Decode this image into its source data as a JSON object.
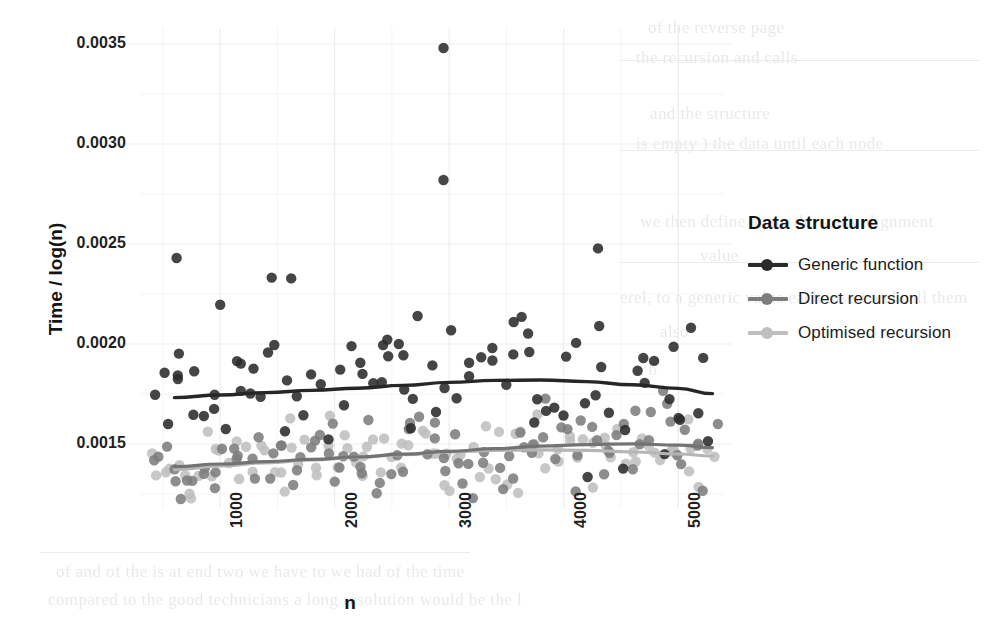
{
  "chart_data": {
    "type": "scatter",
    "title": "",
    "xlabel": "n",
    "ylabel": "Time / log(n)",
    "xlim": [
      300,
      5400
    ],
    "ylim": [
      0.00118,
      0.00358
    ],
    "xticks": [
      1000,
      2000,
      3000,
      4000,
      5000
    ],
    "xtick_labels": [
      "1000",
      "2000",
      "3000",
      "4000",
      "5000"
    ],
    "yticks": [
      0.0015,
      0.002,
      0.0025,
      0.003,
      0.0035
    ],
    "ytick_labels": [
      "0.0015",
      "0.0020",
      "0.0025",
      "0.0030",
      "0.0035"
    ],
    "y_minor_ticks": [
      0.00125,
      0.00175,
      0.00225,
      0.00275,
      0.00325
    ],
    "x_minor_ticks": [
      500,
      1500,
      2500,
      3500,
      4500,
      5000
    ],
    "grid": true,
    "grid_color": "#ededed",
    "grid_minor_color": "#f4f4f4",
    "panel_background": "#ffffff",
    "point_radius": 5.2,
    "point_opacity": 0.88,
    "legend": {
      "title": "Data structure",
      "position": "right",
      "entries": [
        {
          "label": "Generic function",
          "color": "#2b2b2b"
        },
        {
          "label": "Direct recursion",
          "color": "#7d7d7d"
        },
        {
          "label": "Optimised recursion",
          "color": "#bfbfbf"
        }
      ]
    },
    "series": [
      {
        "name": "Generic function",
        "color": "#2b2b2b",
        "n_points": 78,
        "trend": {
          "type": "loess",
          "color": "#262626",
          "width": 3.4,
          "points": [
            [
              600,
              0.001732
            ],
            [
              1000,
              0.001745
            ],
            [
              1400,
              0.001757
            ],
            [
              1800,
              0.001768
            ],
            [
              2200,
              0.001779
            ],
            [
              2600,
              0.001793
            ],
            [
              3000,
              0.001808
            ],
            [
              3400,
              0.001818
            ],
            [
              3800,
              0.00182
            ],
            [
              4200,
              0.001812
            ],
            [
              4600,
              0.001796
            ],
            [
              5000,
              0.001778
            ],
            [
              5300,
              0.001752
            ]
          ]
        },
        "scatter_band": {
          "center_offset": 0.0,
          "spread": 0.000165
        },
        "outliers": [
          [
            2950,
            0.00348
          ],
          [
            2950,
            0.00282
          ],
          [
            4300,
            0.002478
          ],
          [
            620,
            0.00243
          ],
          [
            1450,
            0.002332
          ],
          [
            1620,
            0.002328
          ],
          [
            1000,
            0.002196
          ],
          [
            4310,
            0.00209
          ],
          [
            640,
            0.001952
          ],
          [
            1180,
            0.001902
          ],
          [
            2460,
            0.002022
          ],
          [
            2560,
            0.002
          ],
          [
            2600,
            0.001944
          ],
          [
            3700,
            0.00196
          ],
          [
            3560,
            0.001948
          ],
          [
            4960,
            0.001986
          ]
        ]
      },
      {
        "name": "Direct recursion",
        "color": "#7d7d7d",
        "n_points": 96,
        "trend": {
          "type": "loess",
          "color": "#737373",
          "width": 3.2,
          "points": [
            [
              600,
              0.001387
            ],
            [
              1000,
              0.0014
            ],
            [
              1400,
              0.001412
            ],
            [
              1800,
              0.001423
            ],
            [
              2200,
              0.001435
            ],
            [
              2600,
              0.001449
            ],
            [
              3000,
              0.001463
            ],
            [
              3400,
              0.001477
            ],
            [
              3800,
              0.001489
            ],
            [
              4200,
              0.001497
            ],
            [
              4600,
              0.001501
            ],
            [
              5000,
              0.001494
            ],
            [
              5300,
              0.001482
            ]
          ]
        },
        "scatter_band": {
          "center_offset": 0.0,
          "spread": 0.000105
        },
        "outliers": []
      },
      {
        "name": "Optimised recursion",
        "color": "#bfbfbf",
        "n_points": 96,
        "trend": {
          "type": "loess",
          "color": "#b5b5b5",
          "width": 3.2,
          "points": [
            [
              600,
              0.001372
            ],
            [
              1000,
              0.00139
            ],
            [
              1400,
              0.001406
            ],
            [
              1800,
              0.00142
            ],
            [
              2200,
              0.001433
            ],
            [
              2600,
              0.001447
            ],
            [
              3000,
              0.00146
            ],
            [
              3400,
              0.001468
            ],
            [
              3800,
              0.001471
            ],
            [
              4200,
              0.001468
            ],
            [
              4600,
              0.00146
            ],
            [
              5000,
              0.00145
            ],
            [
              5300,
              0.00144
            ]
          ]
        },
        "scatter_band": {
          "center_offset": 0.0,
          "spread": 9.8e-05
        },
        "outliers": []
      }
    ]
  },
  "layout": {
    "panel_left": 140,
    "panel_right": 724,
    "panel_top": 28,
    "panel_bottom": 508
  },
  "background_text": {
    "note": "faint scanned bleed-through from reverse of page",
    "lines": [
      {
        "text": "of the reverse page",
        "x": 648,
        "y": 18
      },
      {
        "text": "the recursion and calls",
        "x": 636,
        "y": 48
      },
      {
        "text": "and the structure",
        "x": 650,
        "y": 104
      },
      {
        "text": "is empty ) the data until each  node",
        "x": 636,
        "y": 134
      },
      {
        "text": "we then define again  the  stack  alignment",
        "x": 640,
        "y": 212
      },
      {
        "text": "value",
        "x": 700,
        "y": 246
      },
      {
        "text": "erel, to a generic value each  insert  and  call  them",
        "x": 620,
        "y": 288
      },
      {
        "text": "also",
        "x": 660,
        "y": 322
      },
      {
        "text": "a  b",
        "x": 636,
        "y": 360
      },
      {
        "text": "of and of the  is  at  end  two we  have  to  we  had  of the  time",
        "x": 56,
        "y": 562
      },
      {
        "text": "compared to the  good  technicians  a  long  resolution  would  be  the  l",
        "x": 48,
        "y": 590
      }
    ]
  }
}
